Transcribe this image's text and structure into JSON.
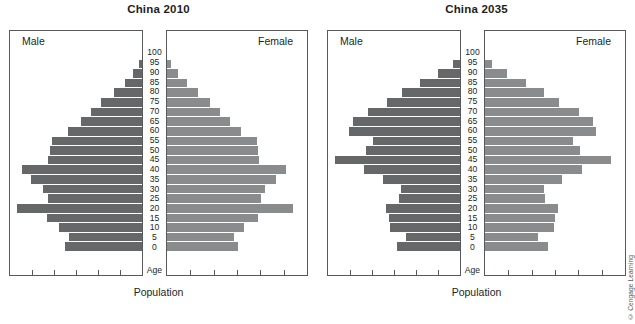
{
  "figure": {
    "credit": "© Cengage Learning",
    "age_caption": "Age",
    "population_caption": "Population",
    "male_label": "Male",
    "female_label": "Female",
    "male_color": "#666769",
    "female_color": "#8a8b8d",
    "border_color": "#58595b"
  },
  "panels": [
    {
      "title": "China 2010"
    },
    {
      "title": "China 2035"
    }
  ],
  "chart_data": [
    {
      "type": "bar",
      "title": "China 2010",
      "subtype": "population-pyramid",
      "xlabel": "Population",
      "ylabel": "Age",
      "grid": false,
      "legend": [
        "Male",
        "Female"
      ],
      "legend_position": "inside-top-corners",
      "axis_tick_count": 5,
      "xlim_male": [
        0,
        100
      ],
      "xlim_female": [
        0,
        100
      ],
      "categories": [
        "0",
        "5",
        "10",
        "15",
        "20",
        "25",
        "30",
        "35",
        "40",
        "45",
        "50",
        "55",
        "60",
        "65",
        "70",
        "75",
        "80",
        "85",
        "90",
        "95",
        "100"
      ],
      "series": [
        {
          "name": "Male",
          "values": [
            58,
            55,
            63,
            72,
            95,
            71,
            75,
            84,
            91,
            71,
            70,
            68,
            56,
            46,
            39,
            31,
            21,
            13,
            7,
            2,
            0
          ]
        },
        {
          "name": "Female",
          "values": [
            51,
            48,
            55,
            65,
            90,
            67,
            70,
            78,
            85,
            66,
            65,
            64,
            53,
            45,
            38,
            31,
            22,
            14,
            8,
            3,
            0
          ]
        }
      ]
    },
    {
      "type": "bar",
      "title": "China 2035",
      "subtype": "population-pyramid",
      "xlabel": "Population",
      "ylabel": "Age",
      "grid": false,
      "legend": [
        "Male",
        "Female"
      ],
      "legend_position": "inside-top-corners",
      "axis_tick_count": 5,
      "xlim_male": [
        0,
        100
      ],
      "xlim_female": [
        0,
        100
      ],
      "categories": [
        "0",
        "5",
        "10",
        "15",
        "20",
        "25",
        "30",
        "35",
        "40",
        "45",
        "50",
        "55",
        "60",
        "65",
        "70",
        "75",
        "80",
        "85",
        "90",
        "95",
        "100"
      ],
      "series": [
        {
          "name": "Male",
          "values": [
            48,
            41,
            53,
            54,
            56,
            46,
            45,
            58,
            73,
            95,
            71,
            66,
            84,
            81,
            70,
            55,
            44,
            30,
            17,
            5,
            0
          ]
        },
        {
          "name": "Female",
          "values": [
            45,
            38,
            49,
            50,
            52,
            43,
            42,
            55,
            69,
            90,
            68,
            63,
            79,
            77,
            67,
            53,
            42,
            29,
            16,
            5,
            0
          ]
        }
      ]
    }
  ]
}
